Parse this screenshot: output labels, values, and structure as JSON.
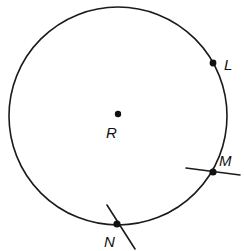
{
  "figure": {
    "type": "geometry-diagram",
    "background_color": "#ffffff",
    "stroke_color": "#1b1b1b",
    "canvas": {
      "width": 244,
      "height": 251
    },
    "circle": {
      "name": "circle-R",
      "center_label": "R",
      "center": {
        "x": 118,
        "y": 116
      },
      "radius": 109,
      "stroke_width": 1.6
    },
    "center_point": {
      "label": "R",
      "label_x": 106,
      "label_y": 138,
      "dot_x": 118,
      "dot_y": 114,
      "dot_r": 3.2
    },
    "points": [
      {
        "label": "L",
        "dot_x": 213,
        "dot_y": 63,
        "dot_r": 3.4,
        "label_x": 224,
        "label_y": 70,
        "has_tangent": false
      },
      {
        "label": "M",
        "dot_x": 213,
        "dot_y": 172,
        "dot_r": 3.6,
        "label_x": 219,
        "label_y": 166,
        "has_tangent": true,
        "tangent": {
          "x1": 186,
          "y1": 168,
          "x2": 240,
          "y2": 175
        }
      },
      {
        "label": "N",
        "dot_x": 117,
        "dot_y": 224,
        "dot_r": 3.6,
        "label_x": 104,
        "label_y": 247,
        "has_tangent": true,
        "tangent": {
          "x1": 107,
          "y1": 205,
          "x2": 135,
          "y2": 249
        }
      }
    ]
  }
}
